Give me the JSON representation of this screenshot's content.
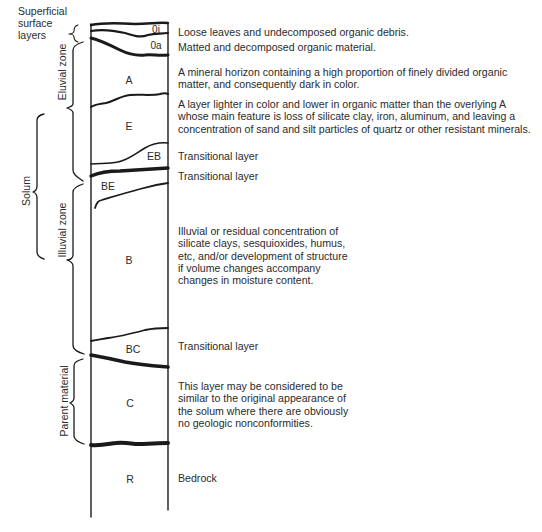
{
  "diagram": {
    "colors": {
      "ink": "#1a1a1a",
      "text": "#2b2b2b",
      "background": "#ffffff"
    },
    "left_labels": {
      "superficial": [
        "Superficial",
        "surface",
        "layers"
      ],
      "solum": "Solum",
      "eluvial_zone": "Eluvial zone",
      "illuvial_zone": "Illuvial zone",
      "parent_material": "Parent material"
    },
    "horizons": [
      {
        "code": "0i",
        "description": [
          "Loose leaves and undecomposed organic debris."
        ]
      },
      {
        "code": "0a",
        "description": [
          "Matted and decomposed organic material."
        ]
      },
      {
        "code": "A",
        "description": [
          "A mineral horizon containing a high proportion of finely divided organic",
          "matter, and consequently dark in color."
        ]
      },
      {
        "code": "E",
        "description": [
          "A layer lighter in color and lower in organic matter than the overlying A",
          "whose main feature is loss of silicate clay, iron, aluminum, and leaving a",
          "concentration of sand and silt particles of quartz or other resistant minerals."
        ]
      },
      {
        "code": "EB",
        "description": [
          "Transitional layer"
        ]
      },
      {
        "code": "BE",
        "description": [
          "Transitional layer"
        ]
      },
      {
        "code": "B",
        "description": [
          "Illuvial or residual concentration of",
          "silicate clays, sesquioxides, humus,",
          "etc, and/or development of structure",
          "if volume changes accompany",
          "changes in moisture content."
        ]
      },
      {
        "code": "BC",
        "description": [
          "Transitional layer"
        ]
      },
      {
        "code": "C",
        "description": [
          "This layer may be considered to be",
          "similar to the original appearance of",
          "the solum where there are obviously",
          "no geologic nonconformities."
        ]
      },
      {
        "code": "R",
        "description": [
          "Bedrock"
        ]
      }
    ]
  }
}
